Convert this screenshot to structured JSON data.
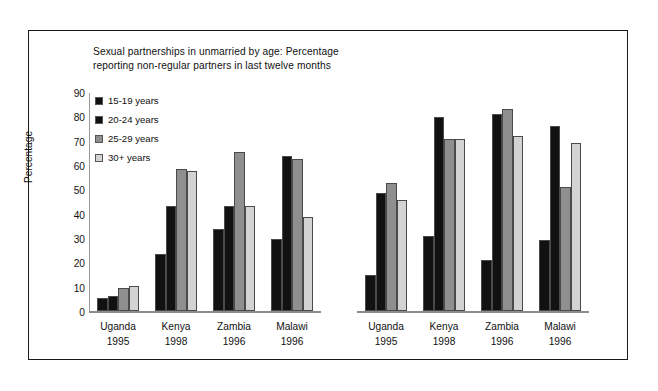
{
  "chart_data": {
    "type": "bar",
    "title": "Sexual partnerships in unmarried by age: Percentage reporting non-regular partners in last twelve months",
    "title_line1": "Sexual partnerships in unmarried by age: Percentage",
    "title_line2": "reporting non-regular partners in last twelve months",
    "xlabel": "",
    "ylabel": "Percentage",
    "ylim": [
      0,
      90
    ],
    "ytick_values": [
      90,
      80,
      70,
      60,
      50,
      40,
      30,
      20,
      10,
      0
    ],
    "ytick_labels": [
      "90",
      "80",
      "70",
      "60",
      "50",
      "40",
      "30",
      "20",
      "10",
      "0"
    ],
    "grid": false,
    "legend_position": "upper-left inside plot",
    "categories": [
      "Uganda 1995",
      "Kenya 1998",
      "Zambia 1996",
      "Malawi 1996",
      "Uganda 1995",
      "Kenya 1998",
      "Zambia 1996",
      "Malawi 1996"
    ],
    "category_labels": [
      {
        "country": "Uganda",
        "year": "1995",
        "panel": "left"
      },
      {
        "country": "Kenya",
        "year": "1998",
        "panel": "left"
      },
      {
        "country": "Zambia",
        "year": "1996",
        "panel": "left"
      },
      {
        "country": "Malawi",
        "year": "1996",
        "panel": "left"
      },
      {
        "country": "Uganda",
        "year": "1995",
        "panel": "right"
      },
      {
        "country": "Kenya",
        "year": "1998",
        "panel": "right"
      },
      {
        "country": "Zambia",
        "year": "1996",
        "panel": "right"
      },
      {
        "country": "Malawi",
        "year": "1996",
        "panel": "right"
      }
    ],
    "series": [
      {
        "name": "15-19 years",
        "color": "#111111",
        "values": [
          5.5,
          23.5,
          33.5,
          29.8,
          15.0,
          31.0,
          21.0,
          29.2
        ]
      },
      {
        "name": "20-24 years",
        "color": "#111111",
        "values": [
          6.3,
          43.0,
          43.0,
          63.5,
          48.5,
          79.8,
          81.0,
          76.0
        ]
      },
      {
        "name": "25-29 years",
        "color": "#8f8f8f",
        "values": [
          9.4,
          58.5,
          65.2,
          62.6,
          52.7,
          70.8,
          83.0,
          51.0
        ]
      },
      {
        "name": "30+ years",
        "color": "#d3d3d3",
        "values": [
          10.2,
          57.5,
          43.2,
          38.6,
          45.5,
          70.8,
          72.0,
          69.0
        ]
      }
    ]
  },
  "legend": {
    "items": [
      {
        "label": "15-19 years",
        "color": "#111111"
      },
      {
        "label": "20-24 years",
        "color": "#111111"
      },
      {
        "label": "25-29 years",
        "color": "#8f8f8f"
      },
      {
        "label": "30+ years",
        "color": "#d3d3d3"
      }
    ]
  },
  "colors": {
    "frame": "#1a1a1a",
    "axis": "#8c8c8c",
    "background": "#ffffff",
    "text": "#111111"
  }
}
